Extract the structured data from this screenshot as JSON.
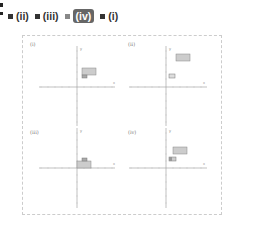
{
  "toolbar": {
    "options": [
      {
        "label": "(ii)",
        "selected": false
      },
      {
        "label": "(iii)",
        "selected": false
      },
      {
        "label": "(iv)",
        "selected": true
      },
      {
        "label": "(i)",
        "selected": false
      }
    ]
  },
  "graphs": [
    {
      "label": "(i)",
      "axis_x": "x",
      "axis_y": "y",
      "range": [
        -10,
        10
      ]
    },
    {
      "label": "(ii)",
      "axis_x": "x",
      "axis_y": "y",
      "range": [
        -10,
        10
      ]
    },
    {
      "label": "(iii)",
      "axis_x": "x",
      "axis_y": "y",
      "range": [
        -10,
        10
      ]
    },
    {
      "label": "(iv)",
      "axis_x": "x",
      "axis_y": "y",
      "range": [
        -10,
        10
      ]
    }
  ],
  "colors": {
    "selected_bg": "#666666",
    "rect_fill": "#cccccc",
    "rect_small_fill": "#aaaaaa"
  }
}
